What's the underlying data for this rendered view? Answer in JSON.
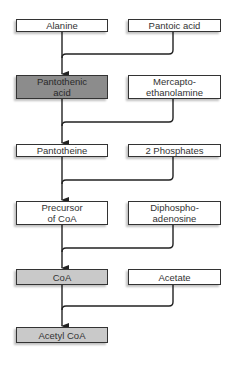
{
  "diagram": {
    "type": "flowchart",
    "colors": {
      "box": "#ffffff",
      "pantothenic": "#8c8c8c",
      "coa": "#c9c9c9",
      "line": "#222222"
    },
    "rows": [
      {
        "left": "Alanine",
        "right": "Pantoic acid"
      },
      {
        "left": "Pantothenic acid",
        "right": "Mercapto-ethanolamine"
      },
      {
        "left": "Pantotheine",
        "right": "2 Phosphates"
      },
      {
        "left": "Precursor of CoA",
        "right": "Diphospho-adenosine"
      },
      {
        "left": "CoA",
        "right": "Acetate"
      },
      {
        "left": "Acetyl CoA"
      }
    ],
    "labels": {
      "alanine": "Alanine",
      "pantoic": "Pantoic acid",
      "pantothenic_1": "Pantothenic",
      "pantothenic_2": "acid",
      "mercapto_1": "Mercapto-",
      "mercapto_2": "ethanolamine",
      "pantotheine": "Pantotheine",
      "phosphates": "2 Phosphates",
      "precursor_1": "Precursor",
      "precursor_2": "of CoA",
      "diphospho_1": "Diphospho-",
      "diphospho_2": "adenosine",
      "coa": "CoA",
      "acetate": "Acetate",
      "acetyl": "Acetyl CoA"
    }
  }
}
